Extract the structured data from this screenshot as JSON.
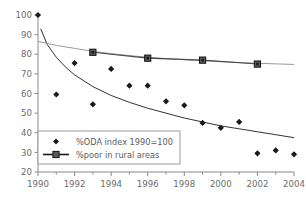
{
  "chart_data": {
    "type": "scatter",
    "title": "",
    "subtitle": "",
    "xlabel": "",
    "ylabel": "",
    "xlim": [
      1990,
      2004
    ],
    "ylim": [
      20,
      100
    ],
    "grid": false,
    "legend_position": "lower-left",
    "x_ticks": [
      1990,
      1992,
      1994,
      1996,
      1998,
      2000,
      2002,
      2004
    ],
    "x_tick_labels": [
      "1990",
      "1992",
      "1994",
      "1996",
      "1998",
      "2000",
      "2002",
      "2004"
    ],
    "x_minor_ticks": [
      1991,
      1993,
      1995,
      1997,
      1999,
      2001,
      2003
    ],
    "y_ticks": [
      20,
      30,
      40,
      50,
      60,
      70,
      80,
      90,
      100
    ],
    "y_tick_labels": [
      "20",
      "30",
      "40",
      "50",
      "60",
      "70",
      "80",
      "90",
      "100"
    ],
    "series": [
      {
        "name": "%ODA index 1990=100",
        "marker": "diamond",
        "color": "#1a1a1a",
        "has_line": false,
        "trendline": true,
        "trendline_color": "#333333",
        "x": [
          1990,
          1991,
          1992,
          1993,
          1994,
          1995,
          1996,
          1997,
          1998,
          1999,
          2000,
          2001,
          2002,
          2003,
          2004
        ],
        "values": [
          100,
          59.5,
          75.5,
          54.5,
          72.5,
          64,
          64,
          56,
          54,
          45,
          42.5,
          45.5,
          29.5,
          31,
          29
        ]
      },
      {
        "name": "%poor in rural areas",
        "marker": "square",
        "color": "#4a4a4a",
        "has_line": true,
        "trendline": true,
        "trendline_color": "#9a9a9a",
        "x": [
          1993,
          1996,
          1999,
          2002
        ],
        "values": [
          81,
          78,
          77,
          75
        ]
      }
    ],
    "trendlines": [
      {
        "name": "ODA trend",
        "color": "#333333",
        "points": [
          [
            1990.15,
            93
          ],
          [
            1990.5,
            85
          ],
          [
            1991,
            78.5
          ],
          [
            1991.5,
            73.5
          ],
          [
            1992,
            69.5
          ],
          [
            1993,
            63.5
          ],
          [
            1994,
            59
          ],
          [
            1995,
            55.5
          ],
          [
            1996,
            52.5
          ],
          [
            1997,
            50
          ],
          [
            1998,
            47.5
          ],
          [
            1999,
            45.5
          ],
          [
            2000,
            43.5
          ],
          [
            2001,
            42
          ],
          [
            2002,
            40.5
          ],
          [
            2003,
            39
          ],
          [
            2004,
            37.5
          ]
        ]
      },
      {
        "name": "rural poor trend",
        "color": "#9a9a9a",
        "points": [
          [
            1990,
            86.5
          ],
          [
            1991,
            84.5
          ],
          [
            1992,
            83
          ],
          [
            1993,
            81.5
          ],
          [
            1994,
            80.3
          ],
          [
            1995,
            79.3
          ],
          [
            1996,
            78.5
          ],
          [
            1997,
            77.8
          ],
          [
            1998,
            77.2
          ],
          [
            1999,
            76.7
          ],
          [
            2000,
            76.2
          ],
          [
            2001,
            75.8
          ],
          [
            2002,
            75.4
          ],
          [
            2003,
            75.1
          ],
          [
            2004,
            74.8
          ]
        ]
      }
    ]
  },
  "legend": {
    "items": [
      {
        "label": "%ODA index 1990=100",
        "marker": "diamond"
      },
      {
        "label": "%poor in rural areas",
        "marker": "square-line"
      }
    ]
  },
  "colors": {
    "axis": "#8a8a8a",
    "text": "#6b6b6b",
    "oda_marker": "#1a1a1a",
    "rural_marker": "#4a4a4a",
    "oda_trend": "#333333",
    "rural_trend": "#9a9a9a",
    "legend_border": "#9a9a9a",
    "background": "#ffffff"
  }
}
